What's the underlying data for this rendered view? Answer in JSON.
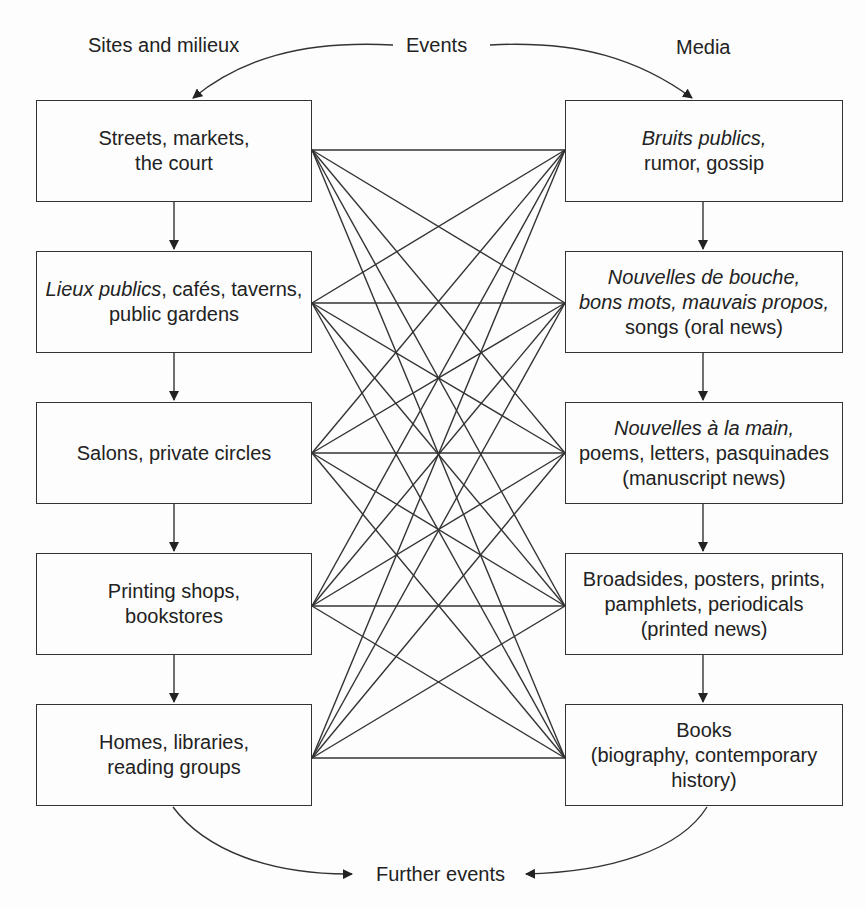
{
  "headers": {
    "left": "Sites and milieux",
    "center": "Events",
    "right": "Media",
    "bottom": "Further events"
  },
  "sites": [
    {
      "lines": [
        {
          "parts": [
            {
              "text": "Streets, markets,",
              "italic": false
            }
          ]
        },
        {
          "parts": [
            {
              "text": "the court",
              "italic": false
            }
          ]
        }
      ]
    },
    {
      "lines": [
        {
          "parts": [
            {
              "text": "Lieux publics",
              "italic": true
            },
            {
              "text": ", cafés, taverns,",
              "italic": false
            }
          ]
        },
        {
          "parts": [
            {
              "text": "public gardens",
              "italic": false
            }
          ]
        }
      ]
    },
    {
      "lines": [
        {
          "parts": [
            {
              "text": "Salons, private circles",
              "italic": false
            }
          ]
        }
      ]
    },
    {
      "lines": [
        {
          "parts": [
            {
              "text": "Printing shops,",
              "italic": false
            }
          ]
        },
        {
          "parts": [
            {
              "text": "bookstores",
              "italic": false
            }
          ]
        }
      ]
    },
    {
      "lines": [
        {
          "parts": [
            {
              "text": "Homes, libraries,",
              "italic": false
            }
          ]
        },
        {
          "parts": [
            {
              "text": "reading groups",
              "italic": false
            }
          ]
        }
      ]
    }
  ],
  "media": [
    {
      "lines": [
        {
          "parts": [
            {
              "text": "Bruits publics,",
              "italic": true
            }
          ]
        },
        {
          "parts": [
            {
              "text": "rumor, gossip",
              "italic": false
            }
          ]
        }
      ]
    },
    {
      "lines": [
        {
          "parts": [
            {
              "text": "Nouvelles de bouche,",
              "italic": true
            }
          ]
        },
        {
          "parts": [
            {
              "text": "bons mots, mauvais propos,",
              "italic": true
            }
          ]
        },
        {
          "parts": [
            {
              "text": "songs (oral news)",
              "italic": false
            }
          ]
        }
      ]
    },
    {
      "lines": [
        {
          "parts": [
            {
              "text": "Nouvelles à la main,",
              "italic": true
            }
          ]
        },
        {
          "parts": [
            {
              "text": "poems, letters, pasquinades",
              "italic": false
            }
          ]
        },
        {
          "parts": [
            {
              "text": "(manuscript news)",
              "italic": false
            }
          ]
        }
      ]
    },
    {
      "lines": [
        {
          "parts": [
            {
              "text": "Broadsides, posters, prints,",
              "italic": false
            }
          ]
        },
        {
          "parts": [
            {
              "text": "pamphlets, periodicals",
              "italic": false
            }
          ]
        },
        {
          "parts": [
            {
              "text": "(printed news)",
              "italic": false
            }
          ]
        }
      ]
    },
    {
      "lines": [
        {
          "parts": [
            {
              "text": "Books",
              "italic": false
            }
          ]
        },
        {
          "parts": [
            {
              "text": "(biography, contemporary",
              "italic": false
            }
          ]
        },
        {
          "parts": [
            {
              "text": "history)",
              "italic": false
            }
          ]
        }
      ]
    }
  ],
  "connections": "every site connects to every medium (5×5)",
  "colors": {
    "line": "#333333",
    "background": "#fdfdfd",
    "text": "#222222"
  }
}
